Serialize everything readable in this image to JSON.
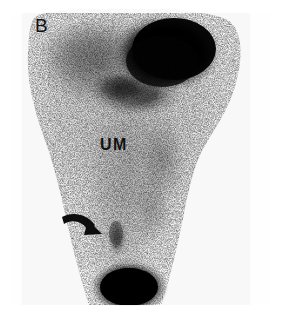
{
  "figure": {
    "modality": "nuclear-medicine-scintigram",
    "panel_letter": "B",
    "region_label": "UM",
    "background_color": "#ffffff",
    "plate_color": "#f7f7f7",
    "ink_color": "#111111"
  },
  "annotations": {
    "panel_letter": {
      "text": "B",
      "name": "panel-letter-b",
      "x": 35,
      "y": 16
    },
    "region_label": {
      "text": "UM",
      "name": "region-label-um",
      "x": 100,
      "y": 137
    },
    "arrow": {
      "name": "lesion-arrow-icon",
      "description": "curved black arrow pointing down-right at focal uptake",
      "x": 60,
      "y": 210,
      "color": "#0d0d0d"
    }
  },
  "scan_features": [
    {
      "name": "upper-right-intense-uptake",
      "label": "",
      "cx": 152,
      "cy": 44,
      "rx": 58,
      "ry": 40,
      "intensity": "intense",
      "gray": "#050505"
    },
    {
      "name": "upper-left-diffuse-uptake",
      "label": "",
      "cx": 86,
      "cy": 60,
      "rx": 62,
      "ry": 46,
      "intensity": "moderate",
      "gray": "#808080"
    },
    {
      "name": "mid-secondary-uptake",
      "label": "",
      "cx": 120,
      "cy": 84,
      "rx": 44,
      "ry": 26,
      "intensity": "high",
      "gray": "#2a2a2a"
    },
    {
      "name": "midline-soft-tissue-background",
      "label": "UM",
      "cx": 118,
      "cy": 165,
      "rx": 58,
      "ry": 80,
      "intensity": "low",
      "gray": "#c8c8c8"
    },
    {
      "name": "focal-lesion-uptake",
      "label": "",
      "cx": 105,
      "cy": 229,
      "rx": 11,
      "ry": 20,
      "intensity": "moderate-focal",
      "gray": "#6e6e6e"
    },
    {
      "name": "bladder-intense-uptake",
      "label": "",
      "cx": 117,
      "cy": 279,
      "rx": 37,
      "ry": 25,
      "intensity": "intense",
      "gray": "#040404"
    }
  ]
}
